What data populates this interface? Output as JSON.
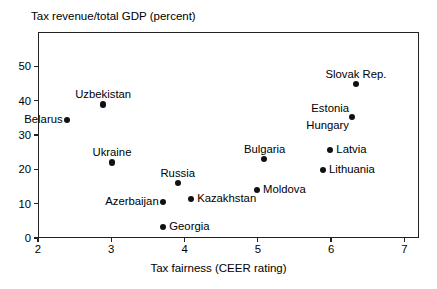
{
  "chart_data": {
    "type": "scatter",
    "title": "Tax revenue/total GDP (percent)",
    "xlabel": "Tax fairness (CEER rating)",
    "ylabel": "Tax revenue/total GDP (percent)",
    "xlim": [
      2,
      7.2
    ],
    "ylim": [
      0,
      60
    ],
    "xticks": [
      2,
      3,
      4,
      5,
      6,
      7
    ],
    "yticks": [
      0,
      10,
      20,
      30,
      40,
      50
    ],
    "grid": false,
    "legend": false,
    "points": [
      {
        "label": "Belarus",
        "x": 2.4,
        "y": 34.3,
        "label_pos": "left"
      },
      {
        "label": "Uzbekistan",
        "x": 2.89,
        "y": 38.9,
        "label_pos": "above"
      },
      {
        "label": "Ukraine",
        "x": 3.01,
        "y": 22.0,
        "label_pos": "above"
      },
      {
        "label": "Azerbaijan",
        "x": 3.71,
        "y": 10.5,
        "label_pos": "left"
      },
      {
        "label": "Georgia",
        "x": 3.71,
        "y": 3.3,
        "label_pos": "right"
      },
      {
        "label": "Russia",
        "x": 3.91,
        "y": 16.0,
        "label_pos": "above"
      },
      {
        "label": "Kazakhstan",
        "x": 4.09,
        "y": 11.4,
        "label_pos": "right"
      },
      {
        "label": "Moldova",
        "x": 4.99,
        "y": 13.9,
        "label_pos": "right"
      },
      {
        "label": "Bulgaria",
        "x": 5.09,
        "y": 22.9,
        "label_pos": "above"
      },
      {
        "label": "Lithuania",
        "x": 5.89,
        "y": 19.9,
        "label_pos": "right"
      },
      {
        "label": "Latvia",
        "x": 5.99,
        "y": 25.6,
        "label_pos": "right"
      },
      {
        "label": "Estonia",
        "x": 6.29,
        "y": 35.2,
        "label_pos": "upper-left"
      },
      {
        "label": "Hungary",
        "x": 6.29,
        "y": 35.2,
        "label_pos": "lower-left"
      },
      {
        "label": "Slovak Rep.",
        "x": 6.34,
        "y": 44.9,
        "label_pos": "above"
      }
    ]
  }
}
